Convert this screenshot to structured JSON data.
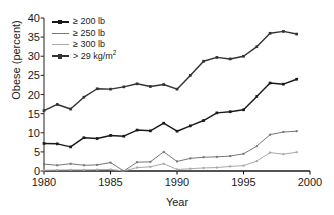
{
  "chart_data": {
    "type": "line",
    "title": "",
    "xlabel": "Year",
    "ylabel": "Obese (percent)",
    "xlim": [
      1980,
      2000
    ],
    "ylim": [
      0,
      40
    ],
    "xticks": [
      "1980",
      "1985",
      "1990",
      "1995",
      "2000"
    ],
    "yticks": [
      "0",
      "5",
      "10",
      "15",
      "20",
      "25",
      "30",
      "35",
      "40"
    ],
    "grid": false,
    "legend_position": "top-left",
    "x": [
      1980,
      1981,
      1982,
      1983,
      1984,
      1985,
      1986,
      1987,
      1988,
      1989,
      1990,
      1991,
      1992,
      1993,
      1994,
      1995,
      1996,
      1997,
      1998,
      1999
    ],
    "series": [
      {
        "name": "> 29 kg/m<sup>2</sup>",
        "label_plain": "> 29 kg/m2",
        "color": "#333333",
        "values": [
          15.8,
          17.4,
          16.2,
          19.3,
          21.5,
          21.4,
          22.0,
          22.8,
          22.1,
          22.6,
          21.4,
          25.0,
          28.7,
          29.7,
          29.3,
          30.0,
          32.5,
          36.0,
          36.5,
          35.8
        ]
      },
      {
        "name": "≥ 200 lb",
        "label_plain": "≥ 200 lb",
        "color": "#1a1a1a",
        "values": [
          7.2,
          7.1,
          6.3,
          8.7,
          8.5,
          9.3,
          9.1,
          10.7,
          10.5,
          12.5,
          10.4,
          11.8,
          13.2,
          15.2,
          15.5,
          16.0,
          19.5,
          23.0,
          22.7,
          24.0
        ]
      },
      {
        "name": "≥ 250 lb",
        "label_plain": "≥ 250 lb",
        "color": "#777777",
        "values": [
          1.8,
          1.5,
          1.9,
          1.5,
          1.6,
          2.2,
          0.0,
          2.3,
          2.4,
          5.0,
          2.5,
          3.3,
          3.6,
          3.7,
          3.9,
          4.5,
          6.5,
          9.5,
          10.2,
          10.4
        ]
      },
      {
        "name": "≥ 300 lb",
        "label_plain": "≥ 300 lb",
        "color": "#a8a8a8",
        "values": [
          0.2,
          0.25,
          0.3,
          0.3,
          0.35,
          0.4,
          0.0,
          0.9,
          1.1,
          1.9,
          0.4,
          0.6,
          0.8,
          0.9,
          1.2,
          1.4,
          2.6,
          4.8,
          4.4,
          4.9
        ]
      }
    ]
  },
  "legend": {
    "items": [
      {
        "label": "≥ 200 lb",
        "color": "#1a1a1a",
        "marker": true
      },
      {
        "label": "≥ 250 lb",
        "color": "#777777",
        "marker": false
      },
      {
        "label": "≥ 300 lb",
        "color": "#a8a8a8",
        "marker": false
      },
      {
        "label": "> 29 kg/m",
        "sup": "2",
        "color": "#333333",
        "marker": true
      }
    ]
  }
}
